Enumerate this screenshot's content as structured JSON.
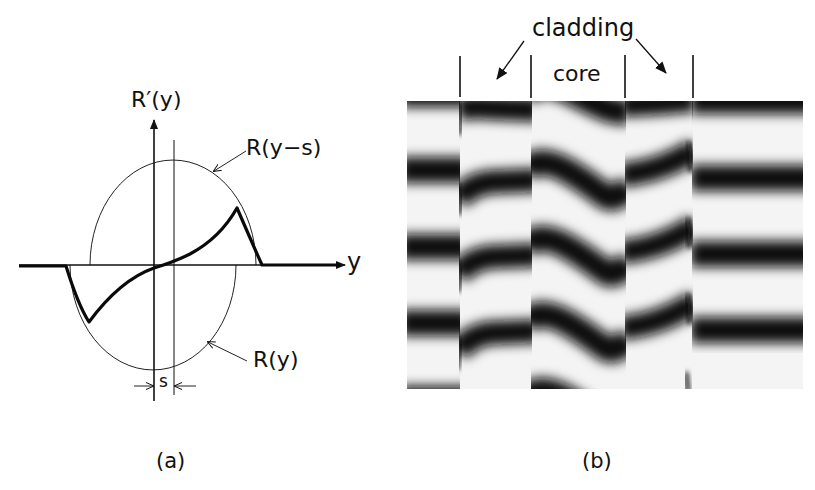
{
  "panel_a": {
    "caption": "(a)",
    "labels": {
      "vertical_axis": "R′(y)",
      "horizontal_axis": "y",
      "shifted_curve": "R(y−s)",
      "original_curve": "R(y)",
      "shift": "s"
    }
  },
  "panel_b": {
    "caption": "(b)",
    "labels": {
      "cladding": "cladding",
      "core": "core"
    }
  }
}
